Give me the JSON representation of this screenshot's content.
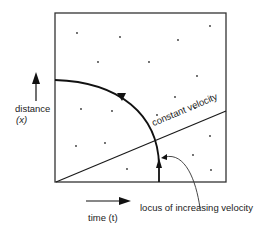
{
  "diagram": {
    "axes": {
      "y_label_line1": "distance",
      "y_label_line2": "(x)",
      "x_label": "time (t)"
    },
    "annotations": {
      "constant_velocity": "constant velocity",
      "locus": "locus of increasing velocity"
    },
    "colors": {
      "line": "#1a1a1a",
      "background": "#ffffff"
    }
  }
}
